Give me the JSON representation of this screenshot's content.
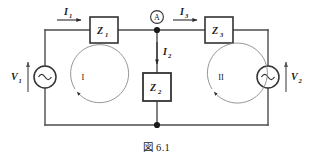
{
  "figure": {
    "caption": "図 6.1",
    "background_color": "#ffffff",
    "line_color": "#4d4d4d",
    "text_color": "#1a1a1a"
  },
  "sources": {
    "left": {
      "label": "V",
      "subscript": "1",
      "symbol": "ac-source",
      "arrow_direction": "up"
    },
    "right": {
      "label": "V",
      "subscript": "2",
      "symbol": "ac-source",
      "arrow_direction": "up"
    }
  },
  "impedances": [
    {
      "label": "Z",
      "subscript": "1",
      "position": "top-left-branch"
    },
    {
      "label": "Z",
      "subscript": "2",
      "position": "middle-branch"
    },
    {
      "label": "Z",
      "subscript": "3",
      "position": "top-right-branch"
    }
  ],
  "currents": [
    {
      "label": "I",
      "subscript": "1",
      "arrow_direction": "right",
      "branch": "left-top"
    },
    {
      "label": "I",
      "subscript": "2",
      "arrow_direction": "down",
      "branch": "middle"
    },
    {
      "label": "I",
      "subscript": "3",
      "arrow_direction": "right",
      "branch": "right-top"
    }
  ],
  "nodes": [
    {
      "label": "A",
      "style": "circled",
      "position": "top-middle"
    }
  ],
  "meshes": [
    {
      "label": "I",
      "direction": "counterclockwise",
      "position": "left"
    },
    {
      "label": "II",
      "direction": "counterclockwise",
      "position": "right"
    }
  ]
}
